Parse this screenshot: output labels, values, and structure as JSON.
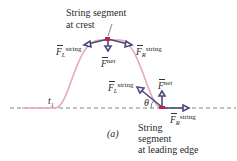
{
  "labels": {
    "crest_line1": "String segment",
    "crest_line2": "at crest",
    "edge_line1": "String",
    "edge_line2": "segment",
    "edge_line3": "at leading edge",
    "t1": "t",
    "t1_sub": "1",
    "theta": "θ",
    "panel": "(a)",
    "F": "F",
    "sup_string": "string",
    "sup_net": "net",
    "sub_L": "L",
    "sub_R": "R"
  },
  "colors": {
    "pulse": "#e8a9b4",
    "arrow": "#4a4a7a",
    "arrow_fill": "#ffffff",
    "segment": "#c0204a",
    "axis": "#555555"
  }
}
